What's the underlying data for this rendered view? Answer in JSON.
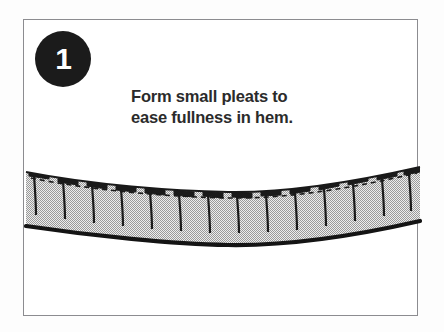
{
  "figure": {
    "name": "sewing-instruction-step",
    "background_color": "#fdfdfd",
    "frame_color": "#8c8c90"
  },
  "badge": {
    "number": "1",
    "background_color": "#1b1b1b",
    "text_color": "#ffffff"
  },
  "caption": {
    "line1": "Form small pleats to",
    "line2": "ease fullness in hem.",
    "color": "#2b2b2b"
  },
  "illustration": {
    "name": "curved-hem-with-pleats",
    "fabric_fill_color": "#c9c9c9",
    "outline_color": "#1a1a1a",
    "stitch_line_style": "dashed",
    "pleat_count": 13,
    "top_edge_description": "gently curved fabric upper edge, dipping in the middle",
    "bottom_edge_description": "thick black curved hem edge sagging at center",
    "pleat_description": "short horizontal tab at top edge with vertical fold line descending into fabric"
  }
}
